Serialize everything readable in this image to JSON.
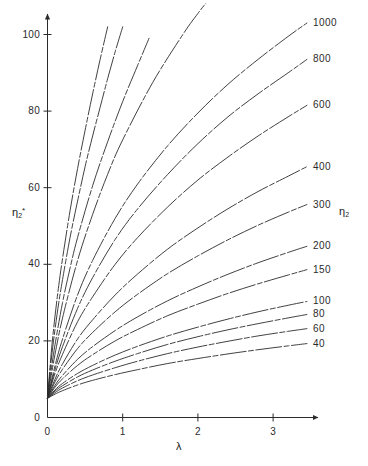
{
  "chart_data": {
    "type": "line",
    "title": "",
    "xlabel": "λ",
    "ylabel": "η₂*",
    "right_axis_label": "η₂",
    "xlim": [
      0,
      3.62
    ],
    "ylim": [
      0,
      107
    ],
    "grid": false,
    "legend_position": "inline-end-labels",
    "x_ticks": [
      "0",
      "1",
      "2",
      "3"
    ],
    "x_tick_values": [
      0,
      1,
      2,
      3
    ],
    "y_ticks": [
      "0",
      "20",
      "40",
      "60",
      "80",
      "100"
    ],
    "y_tick_values": [
      0,
      20,
      40,
      60,
      80,
      100
    ],
    "series": [
      {
        "name": "4000",
        "label_position": "top",
        "x": [
          0.0,
          0.05,
          0.1,
          0.15,
          0.2,
          0.3,
          0.4,
          0.5,
          0.6,
          0.7,
          0.8
        ],
        "values": [
          5.0,
          17.0,
          26.5,
          34.5,
          41.5,
          54.0,
          65.0,
          75.0,
          84.5,
          93.5,
          102.0
        ]
      },
      {
        "name": "3000",
        "label_position": "top",
        "x": [
          0.0,
          0.05,
          0.1,
          0.15,
          0.2,
          0.3,
          0.4,
          0.5,
          0.6,
          0.7,
          0.8,
          0.9,
          1.0
        ],
        "values": [
          5.0,
          15.0,
          23.0,
          30.0,
          36.0,
          47.0,
          56.5,
          65.5,
          73.5,
          81.0,
          88.5,
          95.5,
          102.0
        ]
      },
      {
        "name": "2000",
        "label_position": "top",
        "x": [
          0.0,
          0.05,
          0.1,
          0.2,
          0.3,
          0.4,
          0.6,
          0.8,
          1.0,
          1.2,
          1.35
        ],
        "values": [
          5.0,
          12.5,
          19.0,
          30.0,
          39.0,
          47.0,
          60.5,
          72.0,
          82.5,
          92.0,
          99.0
        ]
      },
      {
        "name": "1500",
        "label_position": "top",
        "x": [
          0.0,
          0.05,
          0.1,
          0.2,
          0.4,
          0.6,
          0.8,
          1.0,
          1.4,
          1.8,
          2.0,
          2.1
        ],
        "values": [
          5.0,
          11.0,
          16.5,
          26.0,
          41.0,
          53.0,
          63.5,
          72.5,
          87.5,
          100.0,
          105.5,
          108.0
        ]
      },
      {
        "name": "1000",
        "label_position": "right",
        "x": [
          0.0,
          0.1,
          0.2,
          0.4,
          0.6,
          0.9,
          1.2,
          1.6,
          2.0,
          2.4,
          2.8,
          3.2,
          3.45
        ],
        "values": [
          5.0,
          13.5,
          20.5,
          32.0,
          41.0,
          52.0,
          61.0,
          71.0,
          79.5,
          87.0,
          93.5,
          99.5,
          103.0
        ]
      },
      {
        "name": "800",
        "label_position": "right",
        "x": [
          0.0,
          0.1,
          0.2,
          0.4,
          0.6,
          0.9,
          1.2,
          1.6,
          2.0,
          2.4,
          2.8,
          3.2,
          3.45
        ],
        "values": [
          5.0,
          12.5,
          18.5,
          28.5,
          36.5,
          46.5,
          54.5,
          63.5,
          71.5,
          78.5,
          84.5,
          90.0,
          93.5
        ]
      },
      {
        "name": "600",
        "label_position": "right",
        "x": [
          0.0,
          0.1,
          0.2,
          0.4,
          0.6,
          0.9,
          1.2,
          1.6,
          2.0,
          2.4,
          2.8,
          3.2,
          3.45
        ],
        "values": [
          5.0,
          11.5,
          16.5,
          25.0,
          31.5,
          40.0,
          47.0,
          55.0,
          62.0,
          68.0,
          73.5,
          78.5,
          81.5
        ]
      },
      {
        "name": "400",
        "label_position": "right",
        "x": [
          0.0,
          0.1,
          0.2,
          0.4,
          0.6,
          0.9,
          1.2,
          1.6,
          2.0,
          2.4,
          2.8,
          3.2,
          3.45
        ],
        "values": [
          5.0,
          10.0,
          14.0,
          20.5,
          25.5,
          32.0,
          37.5,
          44.0,
          49.5,
          54.5,
          59.0,
          63.0,
          65.5
        ]
      },
      {
        "name": "300",
        "label_position": "right",
        "x": [
          0.0,
          0.1,
          0.2,
          0.4,
          0.6,
          0.9,
          1.2,
          1.6,
          2.0,
          2.4,
          2.8,
          3.2,
          3.45
        ],
        "values": [
          5.0,
          9.3,
          12.6,
          18.0,
          22.2,
          27.6,
          32.2,
          37.6,
          42.2,
          46.4,
          50.2,
          53.6,
          55.6
        ]
      },
      {
        "name": "200",
        "label_position": "right",
        "x": [
          0.0,
          0.1,
          0.2,
          0.4,
          0.6,
          0.9,
          1.2,
          1.6,
          2.0,
          2.4,
          2.8,
          3.2,
          3.45
        ],
        "values": [
          5.0,
          8.4,
          11.0,
          15.2,
          18.5,
          22.7,
          26.3,
          30.5,
          34.1,
          37.4,
          40.4,
          43.1,
          44.7
        ]
      },
      {
        "name": "150",
        "label_position": "right",
        "x": [
          0.0,
          0.1,
          0.2,
          0.4,
          0.6,
          0.9,
          1.2,
          1.6,
          2.0,
          2.4,
          2.8,
          3.2,
          3.45
        ],
        "values": [
          5.0,
          7.9,
          10.1,
          13.6,
          16.4,
          20.0,
          23.0,
          26.6,
          29.6,
          32.4,
          34.9,
          37.2,
          38.6
        ]
      },
      {
        "name": "100",
        "label_position": "right",
        "x": [
          0.0,
          0.1,
          0.2,
          0.4,
          0.6,
          0.9,
          1.2,
          1.6,
          2.0,
          2.4,
          2.8,
          3.2,
          3.45
        ],
        "values": [
          5.0,
          7.2,
          8.9,
          11.5,
          13.6,
          16.3,
          18.6,
          21.3,
          23.6,
          25.7,
          27.6,
          29.3,
          30.3
        ]
      },
      {
        "name": "80",
        "label_position": "right",
        "x": [
          0.0,
          0.1,
          0.2,
          0.4,
          0.6,
          0.9,
          1.2,
          1.6,
          2.0,
          2.4,
          2.8,
          3.2,
          3.45
        ],
        "values": [
          5.0,
          6.9,
          8.3,
          10.6,
          12.4,
          14.7,
          16.7,
          19.1,
          21.1,
          22.9,
          24.5,
          26.0,
          26.9
        ]
      },
      {
        "name": "60",
        "label_position": "right",
        "x": [
          0.0,
          0.1,
          0.2,
          0.4,
          0.6,
          0.9,
          1.2,
          1.6,
          2.0,
          2.4,
          2.8,
          3.2,
          3.45
        ],
        "values": [
          5.0,
          6.5,
          7.7,
          9.6,
          11.1,
          13.0,
          14.7,
          16.7,
          18.4,
          19.9,
          21.3,
          22.5,
          23.2
        ]
      },
      {
        "name": "40",
        "label_position": "right",
        "x": [
          0.0,
          0.1,
          0.2,
          0.4,
          0.6,
          0.9,
          1.2,
          1.6,
          2.0,
          2.4,
          2.8,
          3.2,
          3.45
        ],
        "values": [
          5.0,
          6.1,
          7.0,
          8.5,
          9.7,
          11.2,
          12.5,
          14.1,
          15.4,
          16.6,
          17.7,
          18.7,
          19.3
        ]
      }
    ]
  },
  "labels": {
    "top_curve_labels": [
      {
        "text": "4000",
        "x": 0.52,
        "y": 113
      },
      {
        "text": "3000",
        "x": 0.95,
        "y": 113
      },
      {
        "text": "2000",
        "x": 1.52,
        "y": 113
      },
      {
        "text": "1500",
        "x": 2.28,
        "y": 113
      }
    ],
    "right_curve_labels": [
      {
        "text": "1000",
        "value": 103.0
      },
      {
        "text": "800",
        "value": 93.5
      },
      {
        "text": "600",
        "value": 81.5
      },
      {
        "text": "400",
        "value": 65.5
      },
      {
        "text": "300",
        "value": 55.6
      },
      {
        "text": "200",
        "value": 44.7
      },
      {
        "text": "150",
        "value": 38.6
      },
      {
        "text": "100",
        "value": 30.3
      },
      {
        "text": "80",
        "value": 26.9
      },
      {
        "text": "60",
        "value": 23.2
      },
      {
        "text": "40",
        "value": 19.3
      }
    ]
  },
  "colors": {
    "line": "#2b2b2b",
    "axis": "#2b2b2b",
    "text": "#1a1a1a",
    "background": "#ffffff"
  }
}
